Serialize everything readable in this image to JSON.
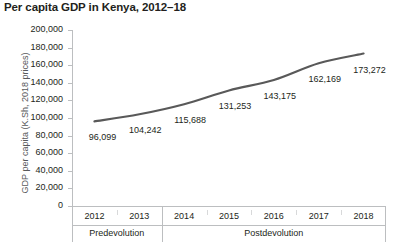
{
  "chart_data": {
    "type": "line",
    "title": "Per capita GDP in Kenya, 2012–18",
    "xlabel": "",
    "ylabel": "GDP per capita (K.Sh, 2018 prices)",
    "categories": [
      "2012",
      "2013",
      "2014",
      "2015",
      "2016",
      "2017",
      "2018"
    ],
    "values": [
      96099,
      104242,
      115688,
      131253,
      143175,
      162169,
      173272
    ],
    "point_labels": [
      "96,099",
      "104,242",
      "115,688",
      "131,253",
      "143,175",
      "162,169",
      "173,272"
    ],
    "ylim": [
      0,
      200000
    ],
    "ytick_step": 20000,
    "ytick_labels": [
      "200,000",
      "180,000",
      "160,000",
      "140,000",
      "120,000",
      "100,000",
      "80,000",
      "60,000",
      "40,000",
      "20,000",
      "0"
    ],
    "ytick_values": [
      200000,
      180000,
      160000,
      140000,
      120000,
      100000,
      80000,
      60000,
      40000,
      20000,
      0
    ],
    "grid": false,
    "legend": "none",
    "smoothing": true,
    "line_color": "#595959",
    "axis_color": "#bcbec0",
    "text_color": "#231f20",
    "groups": [
      {
        "label": "Predevolution",
        "categories": [
          "2012",
          "2013"
        ]
      },
      {
        "label": "Postdevolution",
        "categories": [
          "2014",
          "2015",
          "2016",
          "2017",
          "2018"
        ]
      }
    ]
  }
}
